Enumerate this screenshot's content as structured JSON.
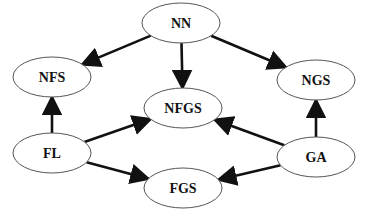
{
  "diagram": {
    "type": "directed-graph",
    "colors": {
      "edge": "#111111",
      "node_stroke": "#555555",
      "node_fill": "#ffffff",
      "text": "#111111"
    },
    "nodes": [
      {
        "id": "NN",
        "label": "NN",
        "cx": 181,
        "cy": 23,
        "rx": 39,
        "ry": 20
      },
      {
        "id": "NFS",
        "label": "NFS",
        "cx": 52,
        "cy": 77,
        "rx": 39,
        "ry": 20
      },
      {
        "id": "NGS",
        "label": "NGS",
        "cx": 316,
        "cy": 80,
        "rx": 39,
        "ry": 20
      },
      {
        "id": "NFGS",
        "label": "NFGS",
        "cx": 183,
        "cy": 108,
        "rx": 39,
        "ry": 20
      },
      {
        "id": "FL",
        "label": "FL",
        "cx": 52,
        "cy": 153,
        "rx": 39,
        "ry": 20
      },
      {
        "id": "GA",
        "label": "GA",
        "cx": 316,
        "cy": 157,
        "rx": 39,
        "ry": 20
      },
      {
        "id": "FGS",
        "label": "FGS",
        "cx": 183,
        "cy": 188,
        "rx": 39,
        "ry": 20
      }
    ],
    "edges": [
      {
        "from": "NN",
        "to": "NFS"
      },
      {
        "from": "NN",
        "to": "NFGS"
      },
      {
        "from": "NN",
        "to": "NGS"
      },
      {
        "from": "FL",
        "to": "NFS"
      },
      {
        "from": "FL",
        "to": "NFGS"
      },
      {
        "from": "FL",
        "to": "FGS"
      },
      {
        "from": "GA",
        "to": "NGS"
      },
      {
        "from": "GA",
        "to": "NFGS"
      },
      {
        "from": "GA",
        "to": "FGS"
      }
    ]
  }
}
